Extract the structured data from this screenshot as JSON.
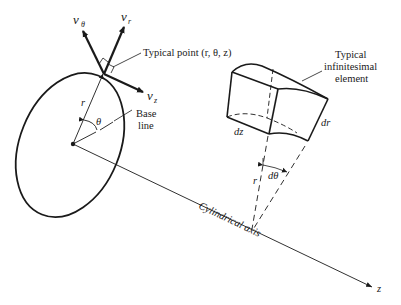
{
  "figure": {
    "colors": {
      "ink": "#1a1a1a",
      "background": "#ffffff"
    }
  },
  "labels": {
    "v_theta": "v",
    "v_theta_sub": "θ",
    "v_r": "v",
    "v_r_sub": "r",
    "v_z": "v",
    "v_z_sub": "z",
    "typical_point": "Typical point (r, θ, z)",
    "radius_r": "r",
    "angle_theta": "θ",
    "base_line_1": "Base",
    "base_line_2": "line",
    "element_1": "Typical",
    "element_2": "infinitesimal",
    "element_3": "element",
    "dz": "dz",
    "dr": "dr",
    "dtheta": "dθ",
    "element_r": "r",
    "cylindrical_axis": "Cylindrical axis",
    "z_axis": "z"
  }
}
